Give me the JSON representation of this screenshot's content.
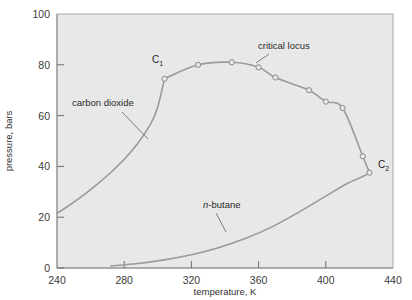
{
  "chart_data": {
    "type": "line",
    "title": "",
    "xlabel": "temperature, K",
    "ylabel": "pressure, bars",
    "xlim": [
      240,
      440
    ],
    "ylim": [
      0,
      100
    ],
    "xticks": [
      240,
      280,
      320,
      360,
      400,
      440
    ],
    "yticks": [
      0,
      20,
      40,
      60,
      80,
      100
    ],
    "grid": false,
    "legend": "none",
    "plot_background": "#e8e8e8",
    "curve_color": "#9a9a9a",
    "axis_color": "#6f6f6f",
    "series": [
      {
        "name": "carbon dioxide",
        "style": "line",
        "markers": false,
        "x": [
          240,
          248,
          256,
          264,
          272,
          280,
          288,
          296,
          300,
          304
        ],
        "y": [
          21.5,
          25.0,
          28.8,
          33.0,
          37.6,
          42.8,
          49.0,
          57.0,
          63.5,
          74.5
        ]
      },
      {
        "name": "n-butane",
        "style": "line",
        "markers": false,
        "x": [
          272,
          288,
          304,
          320,
          336,
          352,
          368,
          384,
          400,
          412,
          422,
          426
        ],
        "y": [
          0.8,
          1.8,
          3.2,
          5.2,
          8.0,
          11.6,
          16.2,
          22.0,
          28.3,
          33.0,
          36.0,
          37.5
        ]
      },
      {
        "name": "critical locus",
        "style": "line",
        "markers": true,
        "x": [
          304,
          324,
          344,
          360,
          370,
          390,
          400,
          410,
          422,
          426
        ],
        "y": [
          74.5,
          80.0,
          81.0,
          79.0,
          75.0,
          70.0,
          65.5,
          63.0,
          44.0,
          37.5
        ]
      }
    ],
    "markers": [
      {
        "x": 304,
        "y": 74.5,
        "label": "C1"
      },
      {
        "x": 324,
        "y": 80.0,
        "label": ""
      },
      {
        "x": 344,
        "y": 81.0,
        "label": ""
      },
      {
        "x": 360,
        "y": 79.0,
        "label": ""
      },
      {
        "x": 370,
        "y": 75.0,
        "label": ""
      },
      {
        "x": 390,
        "y": 70.0,
        "label": ""
      },
      {
        "x": 400,
        "y": 65.5,
        "label": ""
      },
      {
        "x": 410,
        "y": 63.0,
        "label": ""
      },
      {
        "x": 422,
        "y": 44.0,
        "label": ""
      },
      {
        "x": 426,
        "y": 37.5,
        "label": "C2"
      }
    ],
    "annotations": [
      {
        "id": "carbon-dioxide",
        "text": "carbon dioxide",
        "style": "normal",
        "text_x": 72,
        "text_y": 106,
        "leader": [
          [
            122,
            112
          ],
          [
            148,
            139
          ]
        ]
      },
      {
        "id": "critical-locus",
        "text": "critical locus",
        "style": "normal",
        "text_x": 258,
        "text_y": 49,
        "leader": [
          [
            269,
            54
          ],
          [
            256,
            63
          ]
        ]
      },
      {
        "id": "n-butane",
        "text": "n-butane",
        "style": "italic-n",
        "text_x": 203,
        "text_y": 208,
        "leader": [
          [
            216,
            213
          ],
          [
            226,
            232
          ]
        ]
      }
    ],
    "point_labels": [
      {
        "id": "C1",
        "base": "C",
        "sub": "1",
        "x": 152,
        "y": 63
      },
      {
        "id": "C2",
        "base": "C",
        "sub": "2",
        "x": 378,
        "y": 168
      }
    ]
  }
}
